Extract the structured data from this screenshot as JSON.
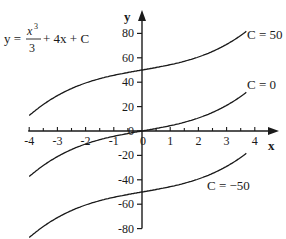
{
  "chart_data": {
    "type": "line",
    "title": "",
    "equation": {
      "lhs": "y =",
      "numerator": "x",
      "exponent": "3",
      "denominator": "3",
      "rest": "+ 4x + C"
    },
    "xlabel": "x",
    "ylabel": "y",
    "xlim": [
      -4,
      4
    ],
    "ylim": [
      -80,
      80
    ],
    "x_ticks": [
      "-4",
      "-3",
      "-2",
      "-1",
      "0",
      "1",
      "2",
      "3",
      "4"
    ],
    "x_tick_values": [
      -4,
      -3,
      -2,
      -1,
      0,
      1,
      2,
      3,
      4
    ],
    "y_ticks": [
      "80",
      "60",
      "40",
      "20",
      "0",
      "-20",
      "-40",
      "-60",
      "-80"
    ],
    "y_tick_values": [
      80,
      60,
      40,
      20,
      0,
      -20,
      -40,
      -60,
      -80
    ],
    "grid": false,
    "legend": "inline labels",
    "x": [
      -4,
      -3,
      -2,
      -1,
      0,
      1,
      2,
      3,
      3.7
    ],
    "series": [
      {
        "name": "C = 50",
        "C": 50,
        "values": [
          12.7,
          29,
          39.3,
          45.7,
          50,
          54.3,
          60.7,
          71,
          81.7
        ]
      },
      {
        "name": "C = 0",
        "C": 0,
        "values": [
          -37.3,
          -21,
          -10.7,
          -4.3,
          0,
          4.3,
          10.7,
          21,
          31.7
        ]
      },
      {
        "name": "C = −50",
        "C": -50,
        "values": [
          -87.3,
          -71,
          -60.7,
          -54.3,
          -50,
          -45.7,
          -39.3,
          -29,
          -18.3
        ]
      }
    ],
    "colors": {
      "line": "#1a1a1a",
      "background": "#ffffff"
    }
  }
}
